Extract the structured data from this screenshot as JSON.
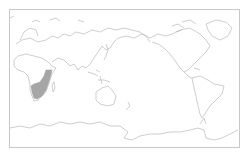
{
  "map": {
    "projection": "equirectangular, Pacific-centered",
    "style": {
      "background": "#ffffff",
      "coastline_color": "#b9b9b9",
      "frame_color": "#c8c8c8",
      "highlight_color": "#a6a6a6"
    },
    "highlighted_region": {
      "name": "East and Southern Africa",
      "description": "Shaded range along eastern and southern Africa"
    },
    "regions_shown": [
      "Africa",
      "Europe",
      "Asia",
      "Australia",
      "North America",
      "South America",
      "Antarctica",
      "Greenland",
      "New Zealand"
    ]
  }
}
